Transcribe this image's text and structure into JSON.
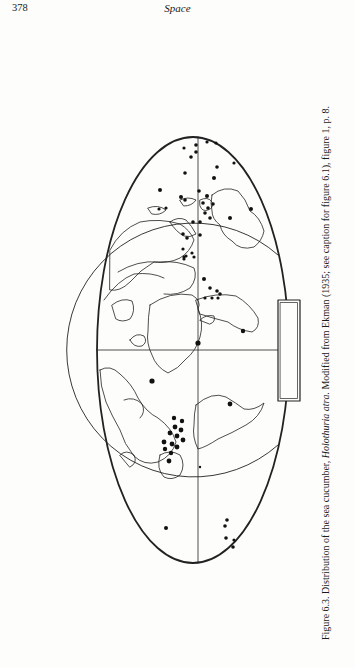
{
  "page": {
    "number": "378",
    "running_head": "Space"
  },
  "figure": {
    "label": "Figure 6.3.",
    "caption_prefix": "Distribution of the sea cucumber,",
    "species": "Holothuria atra.",
    "caption_suffix": "Modified from Ekman (1935; see caption for figure 6.1), figure 1, p. 8.",
    "orientation": "rotated 90° counter-clockwise",
    "map": {
      "projection": "ellipse (world map, rotated)",
      "occurrence_marker_color": "#111111",
      "line_color": "#222222"
    }
  }
}
